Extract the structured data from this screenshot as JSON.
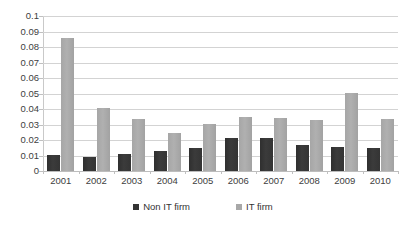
{
  "chart_data": {
    "type": "bar",
    "title": "",
    "subtitle": "",
    "xlabel": "",
    "ylabel": "",
    "categories": [
      "2001",
      "2002",
      "2003",
      "2004",
      "2005",
      "2006",
      "2007",
      "2008",
      "2009",
      "2010"
    ],
    "series": [
      {
        "name": "Non IT firm",
        "color": "#333333",
        "values": [
          0.0103,
          0.0092,
          0.0111,
          0.0128,
          0.0147,
          0.0212,
          0.0212,
          0.0165,
          0.0155,
          0.0151
        ]
      },
      {
        "name": "IT firm",
        "color": "#a8a8a8",
        "values": [
          0.0861,
          0.0404,
          0.0336,
          0.0247,
          0.0304,
          0.0349,
          0.0341,
          0.0332,
          0.0502,
          0.0336
        ]
      }
    ],
    "ylim": [
      0,
      0.1
    ],
    "ytick_step": 0.01,
    "ytick_labels": [
      "0.1",
      "0.09",
      "0.08",
      "0.07",
      "0.06",
      "0.05",
      "0.04",
      "0.03",
      "0.02",
      "0.01",
      "0"
    ],
    "ytick_values": [
      0.1,
      0.09,
      0.08,
      0.07,
      0.06,
      0.05,
      0.04,
      0.03,
      0.02,
      0.01,
      0
    ],
    "grid": true,
    "grid_axis": "y",
    "legend_position": "bottom",
    "legend": [
      "Non IT firm",
      "IT firm"
    ],
    "background": "#ffffff"
  }
}
